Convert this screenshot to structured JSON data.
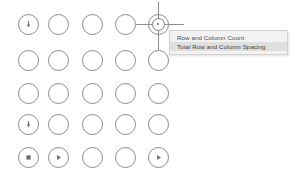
{
  "canvas": {
    "width": 298,
    "height": 181,
    "background": "#ffffff",
    "stroke_color": "#8a8a8a",
    "icon_color": "#6d6d6d"
  },
  "grid": {
    "rows": 5,
    "columns": 5,
    "node_diameter": 21,
    "column_centers_x": [
      28,
      58,
      92,
      125,
      158
    ],
    "row_centers_y": [
      24,
      60,
      93,
      124,
      157
    ],
    "nodes": [
      {
        "row": 1,
        "col": 1,
        "cx": 28,
        "cy": 24,
        "icon": "arrow-down-circle-icon"
      },
      {
        "row": 1,
        "col": 2,
        "cx": 58,
        "cy": 24,
        "icon": ""
      },
      {
        "row": 1,
        "col": 3,
        "cx": 92,
        "cy": 24,
        "icon": ""
      },
      {
        "row": 1,
        "col": 4,
        "cx": 125,
        "cy": 24,
        "icon": ""
      },
      {
        "row": 1,
        "col": 5,
        "cx": 158,
        "cy": 24,
        "icon": ""
      },
      {
        "row": 2,
        "col": 1,
        "cx": 28,
        "cy": 60,
        "icon": ""
      },
      {
        "row": 2,
        "col": 2,
        "cx": 58,
        "cy": 60,
        "icon": ""
      },
      {
        "row": 2,
        "col": 3,
        "cx": 92,
        "cy": 60,
        "icon": ""
      },
      {
        "row": 2,
        "col": 4,
        "cx": 125,
        "cy": 60,
        "icon": ""
      },
      {
        "row": 2,
        "col": 5,
        "cx": 158,
        "cy": 60,
        "icon": ""
      },
      {
        "row": 3,
        "col": 1,
        "cx": 28,
        "cy": 93,
        "icon": ""
      },
      {
        "row": 3,
        "col": 2,
        "cx": 58,
        "cy": 93,
        "icon": ""
      },
      {
        "row": 3,
        "col": 3,
        "cx": 92,
        "cy": 93,
        "icon": ""
      },
      {
        "row": 3,
        "col": 4,
        "cx": 125,
        "cy": 93,
        "icon": ""
      },
      {
        "row": 3,
        "col": 5,
        "cx": 158,
        "cy": 93,
        "icon": ""
      },
      {
        "row": 4,
        "col": 1,
        "cx": 28,
        "cy": 124,
        "icon": "arrow-down-circle-icon"
      },
      {
        "row": 4,
        "col": 2,
        "cx": 58,
        "cy": 124,
        "icon": ""
      },
      {
        "row": 4,
        "col": 3,
        "cx": 92,
        "cy": 124,
        "icon": ""
      },
      {
        "row": 4,
        "col": 4,
        "cx": 125,
        "cy": 124,
        "icon": ""
      },
      {
        "row": 4,
        "col": 5,
        "cx": 158,
        "cy": 124,
        "icon": ""
      },
      {
        "row": 5,
        "col": 1,
        "cx": 28,
        "cy": 157,
        "icon": "stop-square-icon"
      },
      {
        "row": 5,
        "col": 2,
        "cx": 58,
        "cy": 157,
        "icon": "play-triangle-icon"
      },
      {
        "row": 5,
        "col": 3,
        "cx": 92,
        "cy": 157,
        "icon": ""
      },
      {
        "row": 5,
        "col": 4,
        "cx": 125,
        "cy": 157,
        "icon": ""
      },
      {
        "row": 5,
        "col": 5,
        "cx": 158,
        "cy": 157,
        "icon": "play-triangle-icon"
      }
    ]
  },
  "cursor": {
    "name": "crosshair-pick-cursor",
    "x": 158,
    "y": 24,
    "color": "#8e8e8e"
  },
  "context_menu": {
    "x": 169,
    "y": 30,
    "width": 119,
    "background": "#f2f2f2",
    "border_color": "#d2d2d2",
    "highlight_color": "#dfdfdf",
    "items": [
      {
        "label": "Row and Column Count",
        "selected": false
      },
      {
        "label": "Total Row and Column Spacing",
        "selected": true
      }
    ]
  }
}
